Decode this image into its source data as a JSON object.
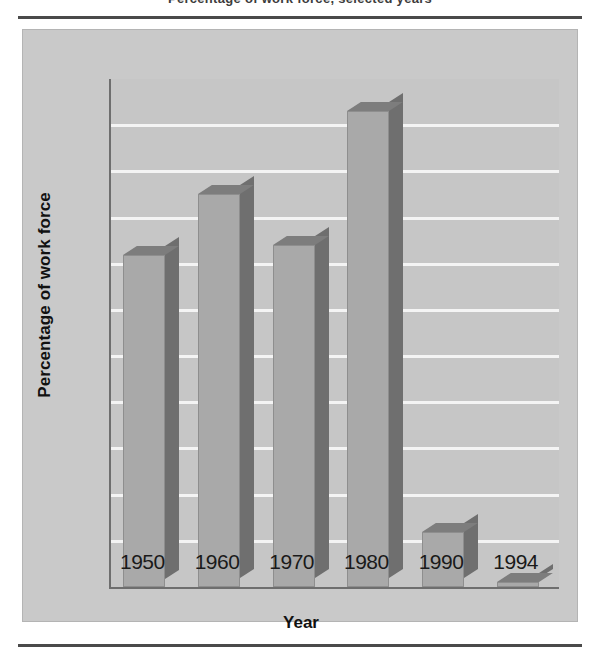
{
  "figure": {
    "clipped_title": "Percentage of work force, selected years",
    "panel_background": "#c9c9c9",
    "bar_face_color": "#a9a9a9",
    "bar_side_color": "#6f6f6f",
    "bar_top_color": "#7d7d7d",
    "gridline_color": "#f4f4f4",
    "axis_color": "#6e6e6e"
  },
  "chart_data": {
    "type": "bar",
    "title": "",
    "xlabel": "Year",
    "ylabel": "Percentage of work force",
    "categories": [
      "1950",
      "1960",
      "1970",
      "1980",
      "1990",
      "1994"
    ],
    "values": [
      22.2,
      23.5,
      22.4,
      25.3,
      16.2,
      15.1
    ],
    "ylim": [
      15,
      26
    ],
    "yticks": [
      15,
      16,
      17,
      18,
      19,
      20,
      21,
      22,
      23,
      24,
      25,
      26
    ],
    "ytick_labels": [
      "15",
      "16",
      "17",
      "18",
      "19",
      "20",
      "21",
      "22",
      "23",
      "24",
      "25",
      "26"
    ],
    "grid": "horizontal",
    "legend": "none",
    "style": "3d-bar"
  }
}
